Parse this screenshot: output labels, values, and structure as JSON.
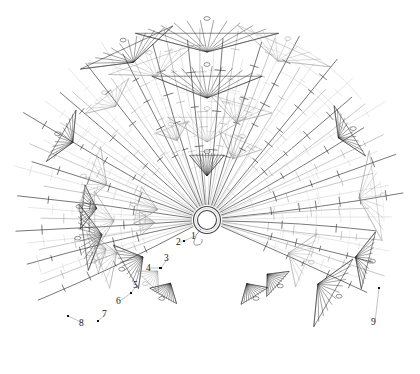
{
  "figure": {
    "type": "radial-phylogram",
    "title": "",
    "background_color": "#ffffff",
    "ink_color": "#222222",
    "faint_color": "#c8c8c8",
    "mid_color": "#8f8f8f",
    "center": {
      "x": 207,
      "y": 220
    },
    "hub": {
      "shape": "double-ring",
      "outer_radius": 13.5,
      "inner_radius": 9.5,
      "stroke": "#444444"
    },
    "angle_span_deg": {
      "start": -205,
      "end": 25
    },
    "n_rays": 64,
    "tick_glyph": "perpendicular-hatch",
    "tip_glyph": "dark-fan-triangle"
  },
  "labels": [
    {
      "id": "1",
      "text": "1",
      "x": 191,
      "y": 232,
      "dot_x": 183,
      "dot_y": 240
    },
    {
      "id": "2",
      "text": "2",
      "x": 176,
      "y": 238,
      "dot_x": 183,
      "dot_y": 240
    },
    {
      "id": "3",
      "text": "3",
      "x": 164,
      "y": 254,
      "dot_x": 160,
      "dot_y": 267
    },
    {
      "id": "4",
      "text": "4",
      "x": 146,
      "y": 264,
      "dot_x": 159,
      "dot_y": 267
    },
    {
      "id": "5",
      "text": "5",
      "x": 133,
      "y": 281,
      "dot_x": 130,
      "dot_y": 292
    },
    {
      "id": "6",
      "text": "6",
      "x": 116,
      "y": 297,
      "dot_x": 130,
      "dot_y": 292
    },
    {
      "id": "7",
      "text": "7",
      "x": 102,
      "y": 310,
      "dot_x": 97,
      "dot_y": 320
    },
    {
      "id": "8",
      "text": "8",
      "x": 79,
      "y": 319,
      "dot_x": 67,
      "dot_y": 315
    },
    {
      "id": "9",
      "text": "9",
      "x": 371,
      "y": 318,
      "dot_x": 378,
      "dot_y": 287
    }
  ],
  "legend": {
    "visible": false,
    "entries": []
  },
  "chart_data": {
    "type": "line",
    "title": "",
    "subtitle": "",
    "xlabel": "",
    "ylabel": "",
    "grid": false,
    "legend_position": "none",
    "series": [
      {
        "name": "radial branches",
        "count": 64,
        "values": [
          0.96,
          0.91,
          0.88,
          0.93,
          0.85,
          0.9,
          0.95,
          0.82,
          0.87,
          0.92,
          0.79,
          0.94,
          0.86,
          0.89,
          0.83,
          0.97,
          0.8,
          0.91,
          0.88,
          0.84,
          0.93,
          0.9,
          0.78,
          0.95,
          0.86,
          0.81,
          0.92,
          0.87,
          0.94,
          0.83,
          0.89,
          0.96,
          0.85,
          0.9,
          0.93,
          0.79,
          0.88,
          0.91,
          0.84,
          0.95,
          0.82,
          0.87,
          0.94,
          0.8,
          0.92,
          0.86,
          0.89,
          0.97,
          0.83,
          0.9,
          0.85,
          0.93,
          0.81,
          0.88,
          0.95,
          0.79,
          0.91,
          0.84,
          0.87,
          0.92,
          0.86,
          0.94,
          0.82,
          0.9
        ]
      },
      {
        "name": "tick-marks per branch",
        "count": 64,
        "values": [
          4,
          3,
          5,
          4,
          2,
          6,
          3,
          4,
          5,
          3,
          2,
          6,
          4,
          3,
          5,
          4,
          2,
          5,
          3,
          4,
          6,
          3,
          2,
          5,
          4,
          3,
          6,
          4,
          5,
          2,
          3,
          6,
          4,
          3,
          5,
          2,
          4,
          6,
          3,
          5,
          2,
          4,
          6,
          3,
          5,
          4,
          3,
          6,
          2,
          5,
          3,
          4,
          2,
          5,
          6,
          3,
          4,
          2,
          5,
          3,
          4,
          6,
          2,
          5
        ]
      }
    ],
    "tip_clades": [
      {
        "angle_deg": -90,
        "radius": 198,
        "size": "large"
      },
      {
        "angle_deg": -90,
        "radius": 152,
        "size": "large"
      },
      {
        "angle_deg": -90,
        "radius": 108,
        "size": "large"
      },
      {
        "angle_deg": -90,
        "radius": 66,
        "size": "medium"
      },
      {
        "angle_deg": -115,
        "radius": 196,
        "size": "medium"
      },
      {
        "angle_deg": -66,
        "radius": 196,
        "size": "medium"
      },
      {
        "angle_deg": -150,
        "radius": 170,
        "size": "small"
      },
      {
        "angle_deg": -32,
        "radius": 170,
        "size": "small"
      },
      {
        "angle_deg": -196,
        "radius": 120,
        "size": "small"
      },
      {
        "angle_deg": 14,
        "radius": 168,
        "size": "small"
      },
      {
        "angle_deg": 30,
        "radius": 150,
        "size": "medium"
      },
      {
        "angle_deg": 22,
        "radius": 110,
        "size": "medium"
      },
      {
        "angle_deg": 42,
        "radius": 96,
        "size": "small"
      },
      {
        "angle_deg": 150,
        "radius": 96,
        "size": "medium"
      },
      {
        "angle_deg": 160,
        "radius": 118,
        "size": "medium"
      },
      {
        "angle_deg": 172,
        "radius": 128,
        "size": "medium"
      },
      {
        "angle_deg": 186,
        "radius": 126,
        "size": "small"
      },
      {
        "angle_deg": 134,
        "radius": 86,
        "size": "small"
      },
      {
        "angle_deg": 120,
        "radius": 88,
        "size": "small"
      },
      {
        "angle_deg": 58,
        "radius": 90,
        "size": "small"
      }
    ]
  }
}
